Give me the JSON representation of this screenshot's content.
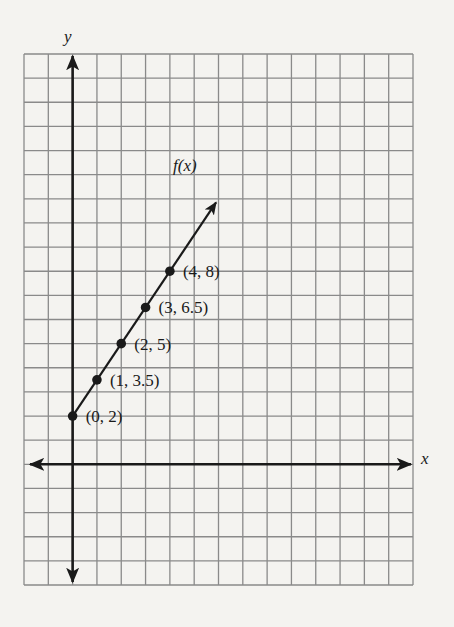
{
  "chart_data": {
    "type": "line",
    "title": "",
    "xlabel": "x",
    "ylabel": "y",
    "function_label": "f(x)",
    "grid": true,
    "xlim": [
      -2,
      14
    ],
    "ylim": [
      -5,
      17
    ],
    "points": [
      {
        "x": 0,
        "y": 2,
        "label": "(0, 2)"
      },
      {
        "x": 1,
        "y": 3.5,
        "label": "(1, 3.5)"
      },
      {
        "x": 2,
        "y": 5,
        "label": "(2, 5)"
      },
      {
        "x": 3,
        "y": 6.5,
        "label": "(3, 6.5)"
      },
      {
        "x": 4,
        "y": 8,
        "label": "(4, 8)"
      }
    ],
    "line": {
      "slope": 1.5,
      "intercept": 2
    }
  },
  "labels": {
    "x_axis": "x",
    "y_axis": "y",
    "function": "f(x)"
  },
  "colors": {
    "background": "#f4f3f0",
    "grid": "#8a8a8a",
    "ink": "#1a1a1a"
  }
}
